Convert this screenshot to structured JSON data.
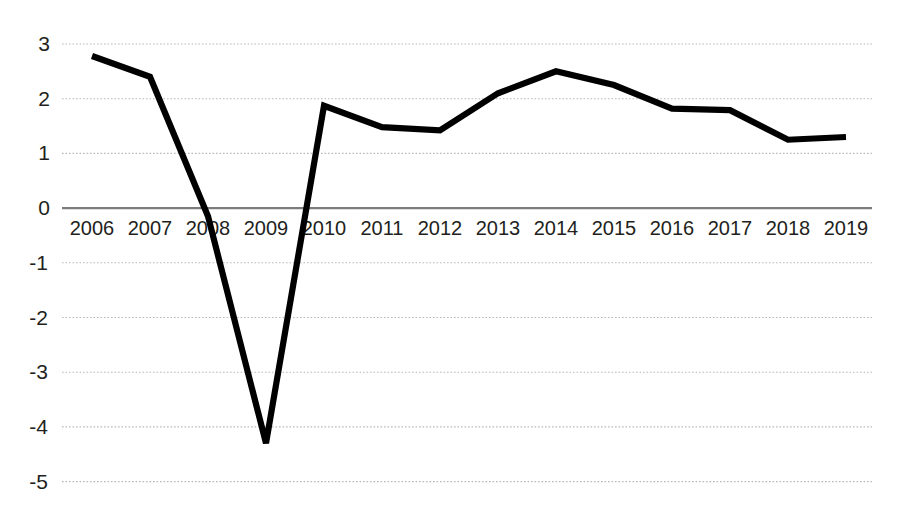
{
  "chart_data": {
    "type": "line",
    "title": "",
    "subtitle": "",
    "xlabel": "",
    "ylabel": "",
    "categories": [
      "2006",
      "2007",
      "2008",
      "2009",
      "2010",
      "2011",
      "2012",
      "2013",
      "2014",
      "2015",
      "2016",
      "2017",
      "2018",
      "2019"
    ],
    "series": [
      {
        "name": "",
        "values": [
          2.78,
          2.4,
          -0.15,
          -4.3,
          1.87,
          1.48,
          1.42,
          2.1,
          2.5,
          2.25,
          1.82,
          1.79,
          1.25,
          1.3
        ]
      }
    ],
    "ylim": [
      -5,
      3
    ],
    "xlim": [
      "2006",
      "2019"
    ],
    "ytick_labels": [
      "3",
      "2",
      "1",
      "0",
      "-1",
      "-2",
      "-3",
      "-4",
      "-5"
    ],
    "ytick_values": [
      3,
      2,
      1,
      0,
      -1,
      -2,
      -3,
      -4,
      -5
    ],
    "grid": true,
    "grid_style": "dotted-horizontal",
    "legend": "none",
    "zero_axis": true,
    "colors": {
      "line": "#000000",
      "grid": "#b9b9b9",
      "zero_axis": "#7c7c7c",
      "text": "#231f20",
      "background": "#ffffff"
    }
  }
}
